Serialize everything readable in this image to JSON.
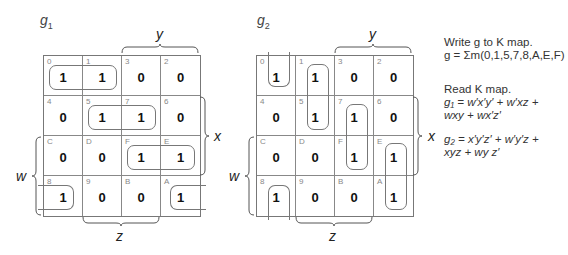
{
  "maps": [
    {
      "id": "g1",
      "title": "g",
      "subscript": "1",
      "cells": [
        {
          "index": "0",
          "value": "1"
        },
        {
          "index": "1",
          "value": "1"
        },
        {
          "index": "3",
          "value": "0"
        },
        {
          "index": "2",
          "value": "0"
        },
        {
          "index": "4",
          "value": "0"
        },
        {
          "index": "5",
          "value": "1"
        },
        {
          "index": "7",
          "value": "1"
        },
        {
          "index": "6",
          "value": "0"
        },
        {
          "index": "C",
          "value": "0"
        },
        {
          "index": "D",
          "value": "0"
        },
        {
          "index": "F",
          "value": "1"
        },
        {
          "index": "E",
          "value": "1"
        },
        {
          "index": "8",
          "value": "1"
        },
        {
          "index": "9",
          "value": "0"
        },
        {
          "index": "B",
          "value": "0"
        },
        {
          "index": "A",
          "value": "1"
        }
      ],
      "labels": {
        "y": "y",
        "x": "x",
        "w": "w",
        "z": "z"
      }
    },
    {
      "id": "g2",
      "title": "g",
      "subscript": "2",
      "cells": [
        {
          "index": "0",
          "value": "1"
        },
        {
          "index": "1",
          "value": "1"
        },
        {
          "index": "3",
          "value": "0"
        },
        {
          "index": "2",
          "value": "0"
        },
        {
          "index": "4",
          "value": "0"
        },
        {
          "index": "5",
          "value": "1"
        },
        {
          "index": "7",
          "value": "1"
        },
        {
          "index": "6",
          "value": "0"
        },
        {
          "index": "C",
          "value": "0"
        },
        {
          "index": "D",
          "value": "0"
        },
        {
          "index": "F",
          "value": "1"
        },
        {
          "index": "E",
          "value": "1"
        },
        {
          "index": "8",
          "value": "1"
        },
        {
          "index": "9",
          "value": "0"
        },
        {
          "index": "B",
          "value": "0"
        },
        {
          "index": "A",
          "value": "1"
        }
      ],
      "labels": {
        "y": "y",
        "x": "x",
        "w": "w",
        "z": "z"
      }
    }
  ],
  "notes": {
    "write_heading": "Write g to K map.",
    "g_equation": "g = Σm(0,1,5,7,8,A,E,F)",
    "read_heading": "Read K map.",
    "g1_line1": "g₁ = w′x′y′ + w′xz +",
    "g1_line2": "wxy + wx′z′",
    "g2_line1": "g₂ = x′y′z′ + w′y′z +",
    "g2_line2": "xyz + wy z′"
  }
}
